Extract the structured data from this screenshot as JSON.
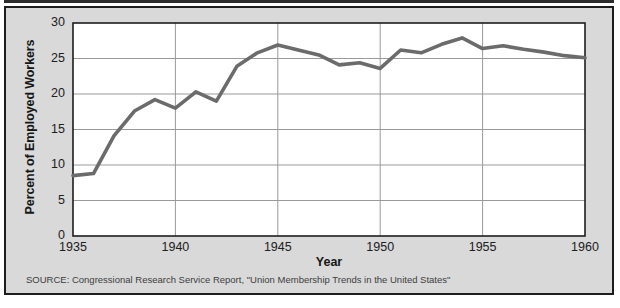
{
  "chart_data": {
    "type": "line",
    "title": "",
    "xlabel": "Year",
    "ylabel": "Percent of Employed Workers",
    "xlim": [
      1935,
      1960
    ],
    "ylim": [
      0,
      30
    ],
    "grid": true,
    "legend": "none",
    "line_color": "#6b6b6b",
    "x": [
      1935,
      1936,
      1937,
      1938,
      1939,
      1940,
      1941,
      1942,
      1943,
      1944,
      1945,
      1946,
      1947,
      1948,
      1949,
      1950,
      1951,
      1952,
      1953,
      1954,
      1955,
      1956,
      1957,
      1958,
      1959,
      1960
    ],
    "values": [
      8.5,
      8.8,
      14.1,
      17.6,
      19.2,
      18.0,
      20.3,
      19.0,
      23.9,
      25.8,
      26.9,
      26.2,
      25.5,
      24.1,
      24.4,
      23.6,
      26.2,
      25.8,
      27.0,
      27.9,
      26.4,
      26.8,
      26.3,
      25.9,
      25.4,
      25.1
    ],
    "x_ticks": [
      1935,
      1940,
      1945,
      1950,
      1955,
      1960
    ],
    "x_tick_labels": [
      "1935",
      "1940",
      "1945",
      "1950",
      "1955",
      "1960"
    ],
    "y_ticks": [
      0,
      5,
      10,
      15,
      20,
      25,
      30
    ],
    "y_tick_labels": [
      "0",
      "5",
      "10",
      "15",
      "20",
      "25",
      "30"
    ]
  },
  "source": {
    "note": "SOURCE: Congressional Research Service Report, \"Union Membership Trends in the United States\""
  }
}
